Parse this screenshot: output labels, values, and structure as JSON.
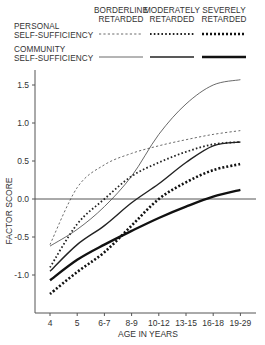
{
  "chart_data": {
    "type": "line",
    "title": "",
    "xlabel": "AGE IN YEARS",
    "ylabel": "FACTOR SCORE",
    "x": [
      "4",
      "5",
      "6-7",
      "8-9",
      "10-12",
      "13-15",
      "16-18",
      "19-29"
    ],
    "ylim": [
      -1.5,
      1.6
    ],
    "yticks": [
      "1.5",
      "1.0",
      "0.5",
      "0.0",
      "-0.5",
      "-1.0"
    ],
    "ytick_values": [
      1.5,
      1.0,
      0.5,
      0.0,
      -0.5,
      -1.0
    ],
    "reference_line": 0.0,
    "grid": false,
    "legend": {
      "placement": "top",
      "columns": [
        "BORDERLINE RETARDED",
        "MODERATELY RETARDED",
        "SEVERELY RETARDED"
      ],
      "column_lines": [
        [
          "BORDERLINE",
          "RETARDED"
        ],
        [
          "MODERATELY",
          "RETARDED"
        ],
        [
          "SEVERELY",
          "RETARDED"
        ]
      ],
      "rows": [
        {
          "label": [
            "PERSONAL",
            "SELF-SUFFICIENCY"
          ],
          "style": "dashed"
        },
        {
          "label": [
            "COMMUNITY",
            "SELF-SUFFICIENCY"
          ],
          "style": "solid"
        }
      ]
    },
    "series": [
      {
        "name": "Personal Self-Sufficiency — Borderline Retarded",
        "factor": "personal",
        "group": "borderline",
        "values": [
          -0.6,
          0.15,
          0.45,
          0.6,
          0.7,
          0.78,
          0.85,
          0.9
        ]
      },
      {
        "name": "Personal Self-Sufficiency — Moderately Retarded",
        "factor": "personal",
        "group": "moderate",
        "values": [
          -0.9,
          -0.33,
          0.0,
          0.3,
          0.48,
          0.62,
          0.72,
          0.75
        ]
      },
      {
        "name": "Personal Self-Sufficiency — Severely Retarded",
        "factor": "personal",
        "group": "severe",
        "values": [
          -1.25,
          -0.96,
          -0.7,
          -0.35,
          0.0,
          0.22,
          0.38,
          0.46
        ]
      },
      {
        "name": "Community Self-Sufficiency — Borderline Retarded",
        "factor": "community",
        "group": "borderline",
        "values": [
          -0.62,
          -0.4,
          -0.1,
          0.3,
          0.85,
          1.25,
          1.5,
          1.57
        ]
      },
      {
        "name": "Community Self-Sufficiency — Moderately Retarded",
        "factor": "community",
        "group": "moderate",
        "values": [
          -0.95,
          -0.6,
          -0.35,
          -0.05,
          0.2,
          0.48,
          0.7,
          0.75
        ]
      },
      {
        "name": "Community Self-Sufficiency — Severely Retarded",
        "factor": "community",
        "group": "severe",
        "values": [
          -1.07,
          -0.8,
          -0.6,
          -0.42,
          -0.25,
          -0.1,
          0.03,
          0.12
        ]
      }
    ]
  }
}
